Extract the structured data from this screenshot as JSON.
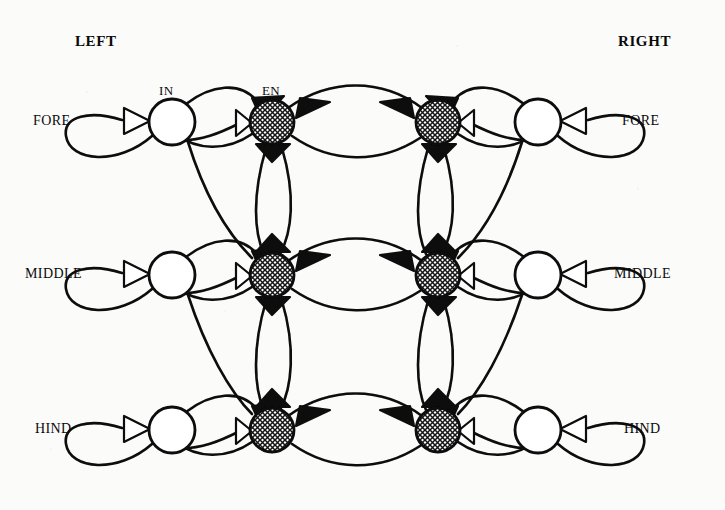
{
  "figure": {
    "kind": "neural-network-connectivity-diagram",
    "background_color": "#fbfbfa",
    "ink_color": "#0a0a0a",
    "side_labels": {
      "left": "LEFT",
      "right": "RIGHT"
    },
    "row_labels": [
      "FORE",
      "MIDDLE",
      "HIND"
    ],
    "node_type_labels": {
      "interneuron": "IN",
      "effector": "EN"
    },
    "node_legend": [
      {
        "key": "IN",
        "label": "IN",
        "fill": "#ffffff",
        "style": "hollow-circle"
      },
      {
        "key": "EN",
        "label": "EN",
        "fill": "#9a9a9a",
        "style": "crosshatched-circle"
      }
    ],
    "synapse_legend": [
      {
        "key": "open",
        "label": "open-triangle",
        "fill": "#ffffff"
      },
      {
        "key": "filled",
        "label": "filled-triangle",
        "fill": "#0a0a0a"
      }
    ],
    "grid": {
      "rows": 3,
      "columns": 4,
      "column_keys": [
        "left-IN",
        "left-EN",
        "right-EN",
        "right-IN"
      ],
      "column_x": [
        172,
        272,
        438,
        538
      ],
      "row_y": [
        122,
        275,
        430
      ],
      "in_radius": 23,
      "en_radius": 22
    },
    "nodes": [
      {
        "id": "L-FORE-IN",
        "type": "IN",
        "side": "left",
        "row": "FORE",
        "x": 172,
        "y": 122,
        "r": 23
      },
      {
        "id": "L-FORE-EN",
        "type": "EN",
        "side": "left",
        "row": "FORE",
        "x": 272,
        "y": 122,
        "r": 22
      },
      {
        "id": "R-FORE-EN",
        "type": "EN",
        "side": "right",
        "row": "FORE",
        "x": 438,
        "y": 122,
        "r": 22
      },
      {
        "id": "R-FORE-IN",
        "type": "IN",
        "side": "right",
        "row": "FORE",
        "x": 538,
        "y": 122,
        "r": 23
      },
      {
        "id": "L-MIDDLE-IN",
        "type": "IN",
        "side": "left",
        "row": "MIDDLE",
        "x": 172,
        "y": 275,
        "r": 23
      },
      {
        "id": "L-MIDDLE-EN",
        "type": "EN",
        "side": "left",
        "row": "MIDDLE",
        "x": 272,
        "y": 275,
        "r": 22
      },
      {
        "id": "R-MIDDLE-EN",
        "type": "EN",
        "side": "right",
        "row": "MIDDLE",
        "x": 438,
        "y": 275,
        "r": 22
      },
      {
        "id": "R-MIDDLE-IN",
        "type": "IN",
        "side": "right",
        "row": "MIDDLE",
        "x": 538,
        "y": 275,
        "r": 23
      },
      {
        "id": "L-HIND-IN",
        "type": "IN",
        "side": "left",
        "row": "HIND",
        "x": 172,
        "y": 430,
        "r": 23
      },
      {
        "id": "L-HIND-EN",
        "type": "EN",
        "side": "left",
        "row": "HIND",
        "x": 272,
        "y": 430,
        "r": 22
      },
      {
        "id": "R-HIND-EN",
        "type": "EN",
        "side": "right",
        "row": "HIND",
        "x": 438,
        "y": 430,
        "r": 22
      },
      {
        "id": "R-HIND-IN",
        "type": "IN",
        "side": "right",
        "row": "HIND",
        "x": 538,
        "y": 430,
        "r": 23
      }
    ],
    "label_positions": {
      "left": {
        "x": 75,
        "y": 33
      },
      "right": {
        "x": 618,
        "y": 33
      },
      "rows_left": [
        {
          "x": 33,
          "y": 113
        },
        {
          "x": 25,
          "y": 266
        },
        {
          "x": 35,
          "y": 421
        }
      ],
      "rows_right": [
        {
          "x": 622,
          "y": 113
        },
        {
          "x": 614,
          "y": 266
        },
        {
          "x": 624,
          "y": 421
        }
      ],
      "in_label": {
        "x": 159,
        "y": 83
      },
      "en_label": {
        "x": 262,
        "y": 83
      }
    }
  }
}
